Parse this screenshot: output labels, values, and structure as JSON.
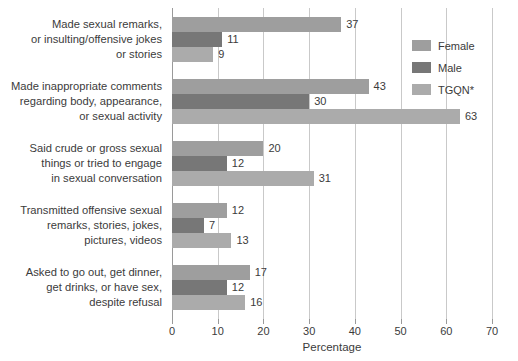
{
  "chart_data": {
    "type": "bar",
    "orientation": "horizontal",
    "title": "",
    "xlabel": "Percentage",
    "ylabel": "",
    "xlim": [
      0,
      70
    ],
    "xticks": [
      0,
      10,
      20,
      30,
      40,
      50,
      60,
      70
    ],
    "grid": "vertical",
    "legend_position": "top-right",
    "categories": [
      [
        "Made sexual remarks,",
        "or insulting/offensive jokes",
        "or stories"
      ],
      [
        "Made inappropriate comments",
        "regarding body, appearance,",
        "or sexual activity"
      ],
      [
        "Said crude or gross sexual",
        "things or tried to engage",
        "in sexual conversation"
      ],
      [
        "Transmitted offensive sexual",
        "remarks, stories, jokes,",
        "pictures, videos"
      ],
      [
        "Asked to go out, get dinner,",
        "get drinks, or have sex,",
        "despite refusal"
      ]
    ],
    "series": [
      {
        "name": "Female",
        "color": "#9e9e9e",
        "values": [
          37,
          43,
          20,
          12,
          17
        ]
      },
      {
        "name": "Male",
        "color": "#777777",
        "values": [
          11,
          30,
          12,
          7,
          12
        ]
      },
      {
        "name": "TGQN*",
        "color": "#ababab",
        "values": [
          9,
          63,
          31,
          13,
          16
        ]
      }
    ]
  },
  "legend": {
    "items": [
      {
        "label": "Female"
      },
      {
        "label": "Male"
      },
      {
        "label": "TGQN*"
      }
    ]
  },
  "axis": {
    "x_title": "Percentage",
    "tick_labels": [
      "0",
      "10",
      "20",
      "30",
      "40",
      "50",
      "60",
      "70"
    ]
  }
}
